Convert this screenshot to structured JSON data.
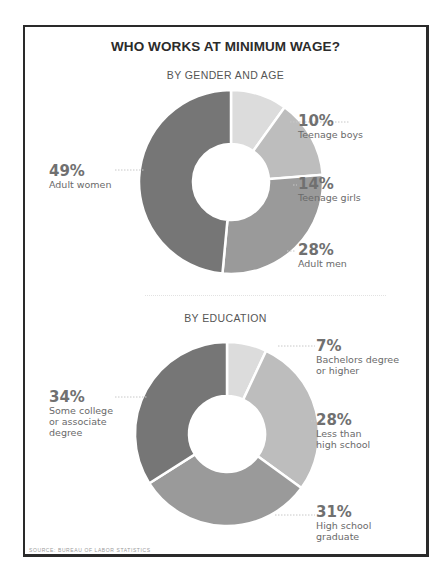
{
  "title": "WHO WORKS AT MINIMUM WAGE?",
  "source": "SOURCE: BUREAU OF LABOR STATISTICS",
  "chart_data": [
    {
      "type": "pie",
      "variant": "donut",
      "title": "BY GENDER AND AGE",
      "categories": [
        "Teenage boys",
        "Teenage girls",
        "Adult men",
        "Adult women"
      ],
      "values": [
        10,
        14,
        28,
        49
      ],
      "unit": "%",
      "colors": [
        "#dcdcdc",
        "#bdbdbd",
        "#9a9a9a",
        "#767676"
      ],
      "start_angle": "12 o'clock, clockwise",
      "legend_position": "callout labels"
    },
    {
      "type": "pie",
      "variant": "donut",
      "title": "BY EDUCATION",
      "categories": [
        "Bachelors degree or higher",
        "Less than high school",
        "High school graduate",
        "Some college or associate degree"
      ],
      "values": [
        7,
        28,
        31,
        34
      ],
      "unit": "%",
      "colors": [
        "#dcdcdc",
        "#bdbdbd",
        "#9a9a9a",
        "#767676"
      ],
      "start_angle": "12 o'clock, clockwise",
      "legend_position": "callout labels"
    }
  ],
  "charts": {
    "gender": {
      "subtitle": "BY GENDER AND AGE",
      "labels": [
        {
          "pct": "10%",
          "text": "Teenage boys"
        },
        {
          "pct": "14%",
          "text": "Teenage girls"
        },
        {
          "pct": "28%",
          "text": "Adult men"
        },
        {
          "pct": "49%",
          "text": "Adult women"
        }
      ]
    },
    "education": {
      "subtitle": "BY EDUCATION",
      "labels": [
        {
          "pct": "7%",
          "text": "Bachelors degree\nor higher"
        },
        {
          "pct": "28%",
          "text": "Less than\nhigh school"
        },
        {
          "pct": "31%",
          "text": "High school\ngraduate"
        },
        {
          "pct": "34%",
          "text": "Some college\nor associate\ndegree"
        }
      ]
    }
  }
}
